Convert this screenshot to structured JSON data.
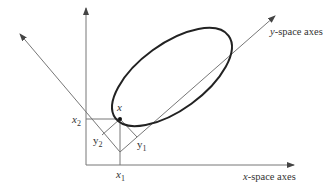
{
  "diagram": {
    "labels": {
      "x_space_prefix": "x",
      "x_space_suffix": "-space axes",
      "y_space_prefix": "y",
      "y_space_suffix": "-space axes",
      "point": "x",
      "x1_base": "x",
      "x1_sub": "1",
      "x2_base": "x",
      "x2_sub": "2",
      "y1_base": "y",
      "y1_sub": "1",
      "y2_base": "y",
      "y2_sub": "2"
    },
    "colors": {
      "axis": "#777777",
      "ellipse": "#222222",
      "text": "#333333"
    }
  }
}
